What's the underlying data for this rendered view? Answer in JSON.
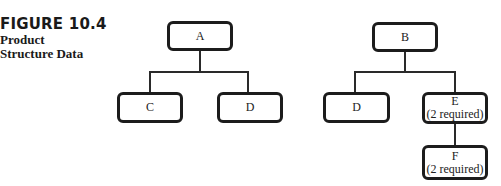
{
  "caption": {
    "figure_number": "FIGURE 10.4",
    "title_line1": "Product",
    "title_line2": "Structure Data"
  },
  "trees": [
    {
      "root": {
        "label": "A"
      },
      "children": [
        {
          "label": "C",
          "note": ""
        },
        {
          "label": "D",
          "note": ""
        }
      ]
    },
    {
      "root": {
        "label": "B"
      },
      "children": [
        {
          "label": "D",
          "note": ""
        },
        {
          "label": "E",
          "note": "(2 required)",
          "children": [
            {
              "label": "F",
              "note": "(2 required)"
            }
          ]
        }
      ]
    }
  ],
  "colors": {
    "box_border": "#1c1c1c",
    "line": "#2a2a2a",
    "text": "#222222",
    "background": "#ffffff"
  }
}
